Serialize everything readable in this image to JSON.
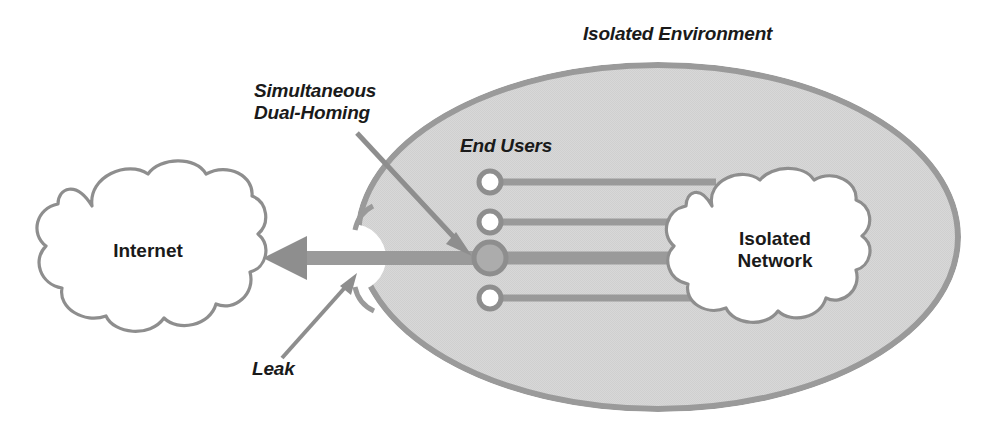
{
  "diagram": {
    "title_label": "Isolated Environment",
    "type": "network-security-diagram",
    "labels": {
      "isolated_environment": "Isolated Environment",
      "simultaneous_dual_homing": "Simultaneous\nDual-Homing",
      "end_users": "End Users",
      "leak": "Leak",
      "internet": "Internet",
      "isolated_network": "Isolated\nNetwork"
    },
    "colors": {
      "ellipse_fill": "#d6d6d6",
      "ellipse_stroke": "#9a9a9a",
      "cloud_fill": "#ffffff",
      "cloud_stroke": "#8e8e8e",
      "line_gray": "#9a9a9a",
      "node_fill_empty": "#ffffff",
      "node_fill_active": "#a8a8a8",
      "node_stroke": "#8e8e8e",
      "leak_arrow": "#8e8e8e",
      "annotation_arrow": "#8e8e8e",
      "text": "#1a1a1a",
      "background": "#ffffff"
    },
    "shapes": {
      "isolated_environment_ellipse": {
        "cx": 658,
        "cy": 237,
        "rx": 303,
        "ry": 175
      },
      "internet_cloud": {
        "x": 30,
        "y": 166,
        "width": 235,
        "height": 174
      },
      "isolated_network_cloud": {
        "x": 660,
        "y": 175,
        "width": 230,
        "height": 155
      },
      "leak_notch": {
        "cx": 358,
        "cy": 258,
        "r": 32
      }
    },
    "end_user_nodes": [
      {
        "id": "user-1",
        "cx": 490,
        "cy": 182,
        "r": 11,
        "state": "normal"
      },
      {
        "id": "user-2",
        "cx": 490,
        "cy": 222,
        "r": 11,
        "state": "normal"
      },
      {
        "id": "user-3",
        "cx": 490,
        "cy": 258,
        "r": 15,
        "state": "dual-homed"
      },
      {
        "id": "user-4",
        "cx": 490,
        "cy": 298,
        "r": 11,
        "state": "normal"
      }
    ],
    "connections": [
      {
        "from": "user-1",
        "to": "isolated-network",
        "x1": 501,
        "x2": 700,
        "y": 182,
        "width": 6
      },
      {
        "from": "user-2",
        "to": "isolated-network",
        "x1": 501,
        "x2": 700,
        "y": 222,
        "width": 6
      },
      {
        "from": "user-3",
        "to": "isolated-network",
        "x1": 505,
        "x2": 700,
        "y": 258,
        "width": 13
      },
      {
        "from": "user-4",
        "to": "isolated-network",
        "x1": 501,
        "x2": 700,
        "y": 298,
        "width": 6
      }
    ],
    "leak_path": {
      "from": "user-3",
      "to": "internet",
      "description": "Thick arrow exiting the isolated environment toward the Internet",
      "x_start": 480,
      "x_end": 263,
      "y": 258,
      "bar_thickness": 13,
      "arrow_head_width": 46,
      "arrow_head_height": 42
    },
    "annotation_arrows": [
      {
        "name": "simultaneous-dual-homing-arrow",
        "x1": 357,
        "y1": 133,
        "x2": 470,
        "y2": 254
      },
      {
        "name": "leak-arrow",
        "x1": 283,
        "y1": 357,
        "x2": 357,
        "y2": 274
      }
    ]
  }
}
